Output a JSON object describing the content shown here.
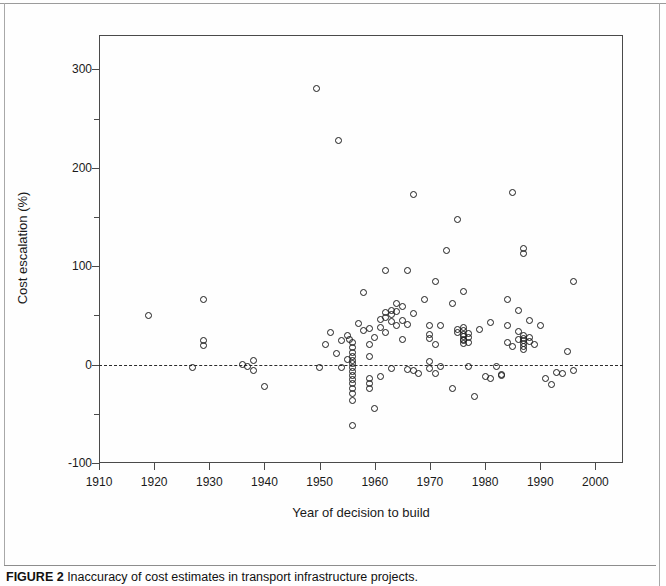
{
  "figure": {
    "caption_label": "FIGURE 2",
    "caption_text": "Inaccuracy of cost estimates in transport infrastructure projects."
  },
  "chart_data": {
    "type": "scatter",
    "title": "",
    "xlabel": "Year of decision to build",
    "ylabel": "Cost escalation (%)",
    "xlim": [
      1910,
      2005
    ],
    "ylim": [
      -100,
      335
    ],
    "xticks": [
      1910,
      1920,
      1930,
      1940,
      1950,
      1960,
      1970,
      1980,
      1990,
      2000
    ],
    "yticks": [
      -100,
      0,
      100,
      200,
      300
    ],
    "yticks_minor": [
      -50,
      50,
      150,
      250
    ],
    "grid": false,
    "legend": "none",
    "marker": "open-circle",
    "marker_color": "#1d1d1d",
    "reference_line": {
      "axis": "y",
      "value": 0,
      "style": "dashed",
      "color": "#2b2b2b"
    },
    "points": [
      [
        1919,
        50
      ],
      [
        1927,
        -3
      ],
      [
        1929,
        66
      ],
      [
        1929,
        24
      ],
      [
        1929,
        19
      ],
      [
        1936,
        0
      ],
      [
        1937,
        -2
      ],
      [
        1938,
        4
      ],
      [
        1938,
        -6
      ],
      [
        1940,
        -22
      ],
      [
        1949.5,
        281
      ],
      [
        1950,
        -3
      ],
      [
        1951,
        20
      ],
      [
        1952,
        33
      ],
      [
        1953,
        11
      ],
      [
        1953.5,
        228
      ],
      [
        1954,
        25
      ],
      [
        1954,
        -3
      ],
      [
        1955,
        5
      ],
      [
        1955,
        30
      ],
      [
        1955.5,
        26
      ],
      [
        1956,
        22
      ],
      [
        1956,
        17
      ],
      [
        1956,
        12
      ],
      [
        1956,
        8
      ],
      [
        1956,
        4
      ],
      [
        1956,
        1
      ],
      [
        1956,
        -3
      ],
      [
        1956,
        -7
      ],
      [
        1956,
        -11
      ],
      [
        1956,
        -15
      ],
      [
        1956,
        -19
      ],
      [
        1956,
        -24
      ],
      [
        1956,
        -29
      ],
      [
        1956,
        -36
      ],
      [
        1956,
        -62
      ],
      [
        1957,
        42
      ],
      [
        1958,
        73
      ],
      [
        1958,
        35
      ],
      [
        1959,
        37
      ],
      [
        1959,
        20
      ],
      [
        1959,
        8
      ],
      [
        1959,
        -14
      ],
      [
        1959,
        -19
      ],
      [
        1959,
        -24
      ],
      [
        1960,
        -45
      ],
      [
        1960,
        28
      ],
      [
        1961,
        46
      ],
      [
        1961,
        38
      ],
      [
        1961,
        -12
      ],
      [
        1962,
        96
      ],
      [
        1962,
        53
      ],
      [
        1962,
        48
      ],
      [
        1962,
        33
      ],
      [
        1963,
        55
      ],
      [
        1963,
        51
      ],
      [
        1963,
        44
      ],
      [
        1963,
        -4
      ],
      [
        1964,
        62
      ],
      [
        1964,
        54
      ],
      [
        1964,
        40
      ],
      [
        1965,
        59
      ],
      [
        1965,
        45
      ],
      [
        1965,
        26
      ],
      [
        1966,
        96
      ],
      [
        1966,
        41
      ],
      [
        1966,
        -5
      ],
      [
        1967,
        173
      ],
      [
        1967,
        52
      ],
      [
        1967,
        -6
      ],
      [
        1968,
        -9
      ],
      [
        1969,
        66
      ],
      [
        1970,
        40
      ],
      [
        1970,
        31
      ],
      [
        1970,
        27
      ],
      [
        1970,
        3
      ],
      [
        1970,
        -4
      ],
      [
        1971,
        84
      ],
      [
        1971,
        20
      ],
      [
        1971,
        -9
      ],
      [
        1972,
        40
      ],
      [
        1972,
        -2
      ],
      [
        1973,
        116
      ],
      [
        1974,
        62
      ],
      [
        1974,
        -24
      ],
      [
        1975,
        147
      ],
      [
        1975,
        36
      ],
      [
        1975,
        33
      ],
      [
        1976,
        74
      ],
      [
        1976,
        38
      ],
      [
        1976,
        35
      ],
      [
        1976,
        31
      ],
      [
        1976,
        29
      ],
      [
        1976,
        26
      ],
      [
        1976,
        24
      ],
      [
        1976,
        21
      ],
      [
        1977,
        32
      ],
      [
        1977,
        28
      ],
      [
        1977,
        22
      ],
      [
        1977,
        -2
      ],
      [
        1978,
        -32
      ],
      [
        1979,
        36
      ],
      [
        1980,
        -12
      ],
      [
        1981,
        -14
      ],
      [
        1981,
        43
      ],
      [
        1982,
        -2
      ],
      [
        1983,
        -11
      ],
      [
        1983,
        -10
      ],
      [
        1984,
        66
      ],
      [
        1984,
        40
      ],
      [
        1984,
        22
      ],
      [
        1985,
        175
      ],
      [
        1985,
        18
      ],
      [
        1986,
        55
      ],
      [
        1986,
        34
      ],
      [
        1986,
        26
      ],
      [
        1987,
        118
      ],
      [
        1987,
        113
      ],
      [
        1987,
        30
      ],
      [
        1987,
        27
      ],
      [
        1987,
        24
      ],
      [
        1987,
        21
      ],
      [
        1987,
        18
      ],
      [
        1987,
        15
      ],
      [
        1988,
        45
      ],
      [
        1988,
        28
      ],
      [
        1988,
        23
      ],
      [
        1989,
        20
      ],
      [
        1990,
        40
      ],
      [
        1991,
        -14
      ],
      [
        1992,
        -20
      ],
      [
        1993,
        -8
      ],
      [
        1994,
        -9
      ],
      [
        1995,
        13
      ],
      [
        1996,
        84
      ],
      [
        1996,
        -6
      ]
    ]
  }
}
